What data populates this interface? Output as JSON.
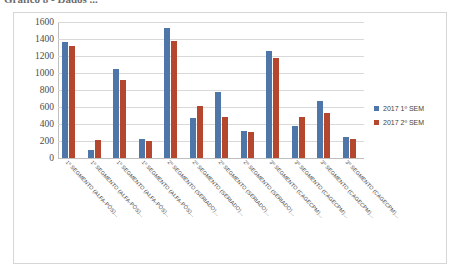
{
  "caption": {
    "text": "Gráfico 8 - Dados ..."
  },
  "legend": {
    "position": "right",
    "items": [
      {
        "label": "2017 1º SEM",
        "color": "#4f76a8"
      },
      {
        "label": "2017 2º SEM",
        "color": "#b4472d"
      }
    ]
  },
  "chart_data": {
    "type": "bar",
    "title": "",
    "xlabel": "",
    "ylabel": "",
    "ylim": [
      0,
      1600
    ],
    "ytick_step": 200,
    "yticks": [
      "1600",
      "1400",
      "1200",
      "1000",
      "800",
      "600",
      "400",
      "200",
      "0"
    ],
    "grid": true,
    "categories": [
      "1º SEGMENTO (ALFA-PÓS)...",
      "1º SEGMENTO (ALFA-PÓS)...",
      "1º SEGMENTO (ALFA-PÓS)...",
      "1º SEGMENTO (ALFA-PÓS)...",
      "2º SEGMENTO (SERIADO)...",
      "2º SEGMENTO (SERIADO)...",
      "2º SEGMENTO (SERIADO)...",
      "2º SEGMENTO (SERIADO)...",
      "3º SEGMENTO (CAGECPM)...",
      "3º SEGMENTO (CAGECPM)...",
      "3º SEGMENTO (CAGECPM)...",
      "3º SEGMENTO (CAGECPM)..."
    ],
    "series": [
      {
        "name": "2017 1º SEM",
        "color": "#4f76a8",
        "values": [
          1360,
          100,
          1050,
          225,
          1530,
          465,
          775,
          320,
          1255,
          380,
          675,
          245
        ]
      },
      {
        "name": "2017 2º SEM",
        "color": "#b4472d",
        "values": [
          1320,
          215,
          920,
          205,
          1380,
          615,
          480,
          305,
          1175,
          485,
          525,
          220
        ]
      }
    ]
  }
}
